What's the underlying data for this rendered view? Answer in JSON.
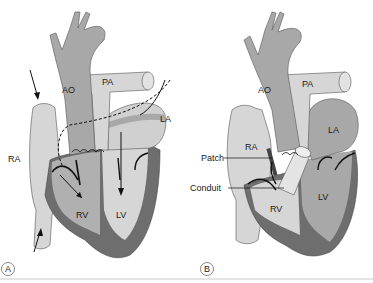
{
  "figure": {
    "panels": [
      {
        "id": "A",
        "label": "A",
        "structures": {
          "ao": "AO",
          "pa": "PA",
          "la": "LA",
          "ra": "RA",
          "rv": "RV",
          "lv": "LV"
        }
      },
      {
        "id": "B",
        "label": "B",
        "structures": {
          "ao": "AO",
          "pa": "PA",
          "la": "LA",
          "ra": "RA",
          "rv": "RV",
          "lv": "LV"
        },
        "callouts": {
          "patch": "Patch",
          "conduit": "Conduit"
        }
      }
    ],
    "colors": {
      "light": "#d6d6d6",
      "mid": "#a8a8a8",
      "dark": "#6e6e6e",
      "outline": "#444444",
      "line": "#111111"
    }
  }
}
